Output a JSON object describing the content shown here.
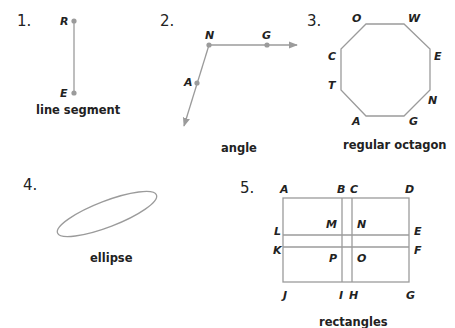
{
  "colors": {
    "text": "#222222",
    "line": "#9b9b9b",
    "background": "#ffffff"
  },
  "figures": [
    {
      "number": "1.",
      "caption": "line segment",
      "points": {
        "top": "R",
        "bottom": "E"
      }
    },
    {
      "number": "2.",
      "caption": "angle",
      "points": {
        "vertex": "N",
        "ray1_point": "G",
        "ray2_point": "A"
      }
    },
    {
      "number": "3.",
      "caption": "regular octagon",
      "points": [
        "O",
        "W",
        "E",
        "N",
        "G",
        "A",
        "T",
        "C"
      ]
    },
    {
      "number": "4.",
      "caption": "ellipse"
    },
    {
      "number": "5.",
      "caption": "rectangles",
      "points": {
        "A": "A",
        "B": "B",
        "C": "C",
        "D": "D",
        "L": "L",
        "M": "M",
        "N": "N",
        "E": "E",
        "K": "K",
        "P": "P",
        "O": "O",
        "F": "F",
        "J": "J",
        "I": "I",
        "H": "H",
        "G": "G"
      }
    }
  ]
}
